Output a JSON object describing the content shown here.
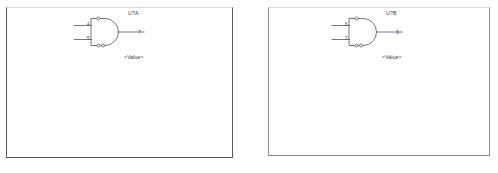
{
  "document": {
    "type": "schematic-capture",
    "background_color": "#ffffff",
    "line_color": "#4a4a5a"
  },
  "panels": [
    {
      "name": "left-sheet",
      "border_color": "#5a5a5a"
    },
    {
      "name": "right-sheet",
      "border_color": "#8d8d8d"
    }
  ],
  "gates": [
    {
      "reference": "U?A",
      "value": "<Value>",
      "symbol": "and-gate",
      "pins": {
        "input_a": "4",
        "input_b": "5",
        "output": "7"
      }
    },
    {
      "reference": "U?B",
      "value": "<Value>",
      "symbol": "and-gate",
      "pins": {
        "input_a": "6",
        "input_b": "7",
        "output": "3"
      }
    }
  ]
}
